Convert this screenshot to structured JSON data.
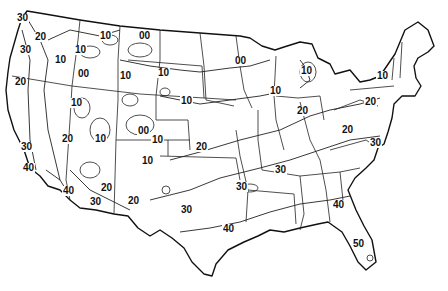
{
  "map": {
    "title": "",
    "region": "Contiguous United States",
    "type": "isoline contour map",
    "labels": [
      {
        "text": "30",
        "x": 22,
        "y": 18
      },
      {
        "text": "20",
        "x": 40,
        "y": 37
      },
      {
        "text": "30",
        "x": 25,
        "y": 50
      },
      {
        "text": "10",
        "x": 60,
        "y": 60
      },
      {
        "text": "10",
        "x": 80,
        "y": 50
      },
      {
        "text": "00",
        "x": 83,
        "y": 74
      },
      {
        "text": "10",
        "x": 105,
        "y": 36
      },
      {
        "text": "00",
        "x": 144,
        "y": 36
      },
      {
        "text": "10",
        "x": 125,
        "y": 76
      },
      {
        "text": "20",
        "x": 20,
        "y": 82
      },
      {
        "text": "10",
        "x": 76,
        "y": 103
      },
      {
        "text": "10",
        "x": 163,
        "y": 73
      },
      {
        "text": "10",
        "x": 186,
        "y": 101
      },
      {
        "text": "00",
        "x": 240,
        "y": 61
      },
      {
        "text": "10",
        "x": 306,
        "y": 71
      },
      {
        "text": "10",
        "x": 275,
        "y": 91
      },
      {
        "text": "10",
        "x": 382,
        "y": 76
      },
      {
        "text": "20",
        "x": 370,
        "y": 102
      },
      {
        "text": "20",
        "x": 302,
        "y": 111
      },
      {
        "text": "20",
        "x": 347,
        "y": 130
      },
      {
        "text": "20",
        "x": 67,
        "y": 139
      },
      {
        "text": "10",
        "x": 100,
        "y": 139
      },
      {
        "text": "00",
        "x": 143,
        "y": 131
      },
      {
        "text": "10",
        "x": 157,
        "y": 140
      },
      {
        "text": "10",
        "x": 147,
        "y": 161
      },
      {
        "text": "20",
        "x": 201,
        "y": 147
      },
      {
        "text": "30",
        "x": 26,
        "y": 147
      },
      {
        "text": "30",
        "x": 375,
        "y": 143
      },
      {
        "text": "30",
        "x": 280,
        "y": 170
      },
      {
        "text": "40",
        "x": 28,
        "y": 168
      },
      {
        "text": "40",
        "x": 68,
        "y": 191
      },
      {
        "text": "20",
        "x": 106,
        "y": 188
      },
      {
        "text": "30",
        "x": 95,
        "y": 202
      },
      {
        "text": "20",
        "x": 133,
        "y": 201
      },
      {
        "text": "30",
        "x": 186,
        "y": 210
      },
      {
        "text": "30",
        "x": 241,
        "y": 187
      },
      {
        "text": "40",
        "x": 338,
        "y": 205
      },
      {
        "text": "40",
        "x": 228,
        "y": 229
      },
      {
        "text": "50",
        "x": 358,
        "y": 244
      }
    ]
  }
}
